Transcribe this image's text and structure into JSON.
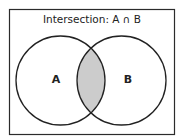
{
  "diagram": {
    "title": "Intersection: A ∩ B",
    "sets": [
      {
        "label": "A"
      },
      {
        "label": "B"
      }
    ],
    "highlighted_region": "A ∩ B",
    "colors": {
      "border": "#2b2b2b",
      "highlight_fill": "#cccccc",
      "background": "#ffffff"
    }
  }
}
